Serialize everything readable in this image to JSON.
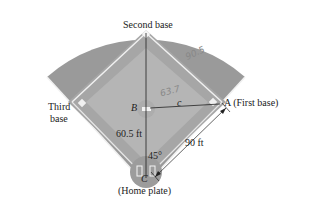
{
  "figure": {
    "type": "baseball diamond geometry",
    "labels": {
      "second_base": "Second base",
      "third_base_line1": "Third",
      "third_base_line2": "base",
      "first_base": "A (First base)",
      "home_plate": "(Home plate)",
      "point_b": "B",
      "point_c": "C",
      "side_c": "c",
      "dist_mound": "60.5 ft",
      "dist_base": "90 ft",
      "angle": "45°"
    },
    "handwritten": {
      "outfield_note": "90.5",
      "infield_note": "63.7"
    },
    "colors": {
      "outfield": "#9a9a9a",
      "infield_dirt": "#a8a8a8",
      "infield_grass": "#b4b4b4",
      "base_lines": "#f0f0f0",
      "ink": "#222222"
    }
  }
}
